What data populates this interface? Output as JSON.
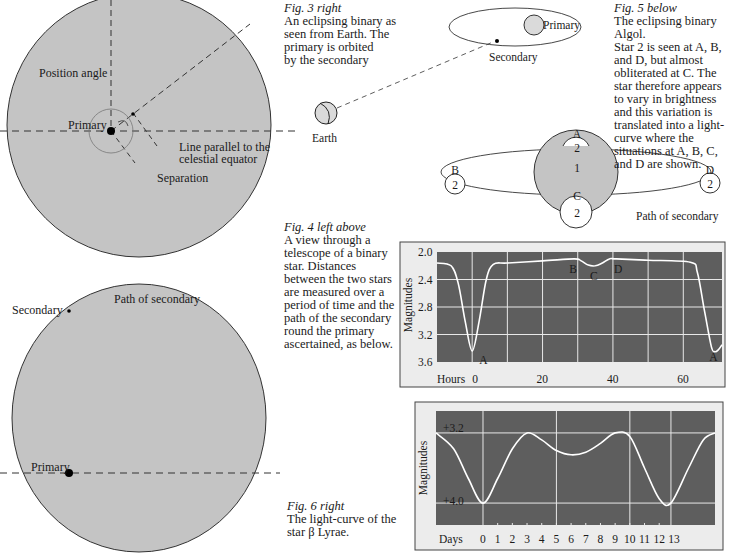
{
  "fig3": {
    "caption_title": "Fig. 3  right",
    "caption_lines": [
      "An eclipsing binary as",
      "seen from Earth. The",
      "primary is orbited",
      "by the secondary"
    ],
    "labels": {
      "primary": "Primary",
      "secondary": "Secondary",
      "earth": "Earth"
    }
  },
  "fig4": {
    "caption_title": "Fig. 4  left above",
    "caption_lines": [
      "A view through a",
      "telescope of a binary",
      "star. Distances",
      "between the two stars",
      "are measured over a",
      "period of time and the",
      "path of the secondary",
      "round the primary",
      "ascertained, as below."
    ],
    "top_disc": {
      "labels": {
        "position_angle": "Position angle",
        "primary": "Primary",
        "line_parallel_1": "Line parallel to the",
        "line_parallel_2": "celestial equator",
        "separation": "Separation"
      }
    },
    "bottom_disc": {
      "labels": {
        "secondary": "Secondary",
        "path": "Path of secondary",
        "primary": "Primary"
      }
    }
  },
  "fig5": {
    "caption_title": "Fig. 5  below",
    "caption_lines": [
      "The eclipsing binary",
      "Algol.",
      "Star 2 is seen at A, B,",
      "and D, but almost",
      "obliterated at C. The",
      "star therefore appears",
      "to vary in brightness",
      "and this variation is",
      "translated into a light-",
      "curve where the",
      "situations at A, B, C,",
      "and D are shown."
    ],
    "labels": {
      "A": "A",
      "B": "B",
      "C": "C",
      "D": "D",
      "star1": "1",
      "star2": "2",
      "path": "Path of secondary"
    }
  },
  "fig6": {
    "caption_title": "Fig. 6  right",
    "caption_lines": [
      "The light-curve of the",
      "star β Lyrae."
    ]
  },
  "colors": {
    "disc_fill": "#c4c4c4",
    "chart_bg": "#5e5e5e",
    "chart_frame": "#ececec",
    "curve": "#ffffff",
    "star_fill": "#dadada"
  },
  "chart_data": [
    {
      "type": "line",
      "title": "Algol light-curve",
      "xlabel": "Hours",
      "ylabel": "Magnitudes",
      "x_ticks": [
        "0",
        "20",
        "40",
        "60"
      ],
      "y_ticks": [
        "2.0",
        "2.4",
        "2.8",
        "3.2",
        "3.6"
      ],
      "ylim": [
        3.6,
        2.0
      ],
      "xlim": [
        -10,
        71
      ],
      "grid": true,
      "annotations": [
        "A",
        "B",
        "C",
        "D",
        "A"
      ],
      "x": [
        -10,
        -6,
        -4,
        -2,
        0,
        2,
        4,
        6,
        10,
        20,
        29,
        31,
        33,
        35,
        37,
        39,
        41,
        50,
        62,
        64,
        66,
        68,
        69,
        70,
        71
      ],
      "values": [
        2.16,
        2.2,
        2.45,
        3.0,
        3.44,
        3.0,
        2.4,
        2.18,
        2.16,
        2.13,
        2.1,
        2.13,
        2.19,
        2.2,
        2.16,
        2.1,
        2.1,
        2.12,
        2.15,
        2.3,
        2.85,
        3.38,
        3.45,
        3.42,
        3.35
      ]
    },
    {
      "type": "line",
      "title": "β Lyrae light-curve",
      "xlabel": "Days",
      "ylabel": "Magnitudes",
      "x_ticks": [
        "0",
        "1",
        "2",
        "3",
        "4",
        "5",
        "6",
        "7",
        "8",
        "9",
        "10",
        "11",
        "12",
        "13"
      ],
      "y_ticks": [
        "+3.2",
        "+4.0"
      ],
      "ylim": [
        4.25,
        2.95
      ],
      "xlim": [
        -3.2,
        15.8
      ],
      "grid": true,
      "x": [
        -3.2,
        -2,
        -1,
        0,
        1,
        2,
        3,
        4,
        5,
        6,
        7,
        8,
        9,
        10,
        11,
        12,
        12.8,
        14,
        15,
        15.8
      ],
      "values": [
        3.2,
        3.38,
        3.72,
        4.0,
        3.72,
        3.38,
        3.2,
        3.28,
        3.4,
        3.45,
        3.42,
        3.32,
        3.2,
        3.24,
        3.6,
        3.95,
        4.0,
        3.6,
        3.28,
        3.2
      ]
    }
  ]
}
